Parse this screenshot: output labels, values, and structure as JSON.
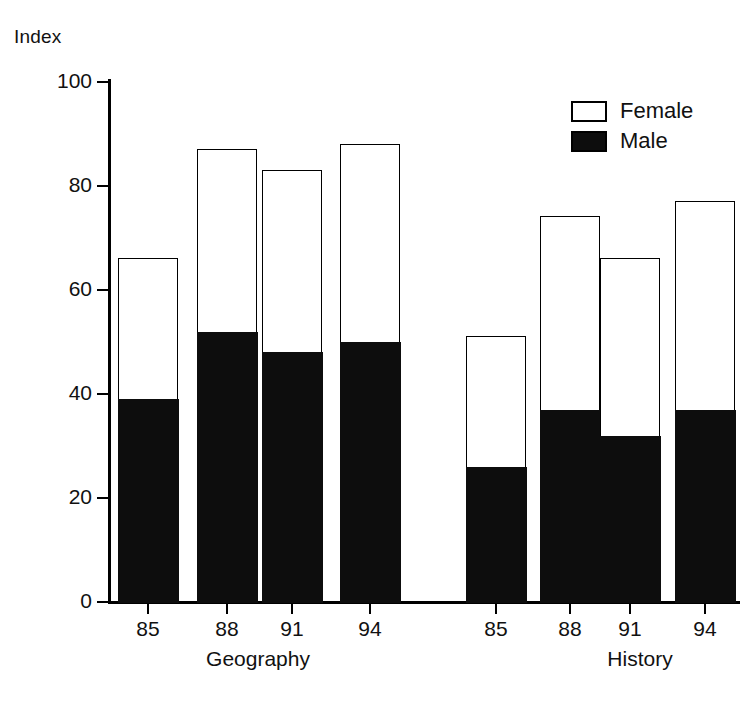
{
  "chart_data": {
    "type": "bar",
    "subtype": "stacked-bar",
    "title": "",
    "ylabel": "Index",
    "xlabel": "",
    "ylim": [
      0,
      100
    ],
    "yticks": [
      0,
      20,
      40,
      60,
      80,
      100
    ],
    "grid": false,
    "legend": {
      "position": "top-right",
      "entries": [
        {
          "name": "Female",
          "fill": "#ffffff",
          "stroke": "#000000"
        },
        {
          "name": "Male",
          "fill": "#0d0d0d",
          "stroke": "#000000"
        }
      ]
    },
    "groups": [
      {
        "name": "Geography",
        "categories": [
          "85",
          "88",
          "91",
          "94"
        ]
      },
      {
        "name": "History",
        "categories": [
          "85",
          "88",
          "91",
          "94"
        ]
      }
    ],
    "categories": [
      "85",
      "88",
      "91",
      "94",
      "85",
      "88",
      "91",
      "94"
    ],
    "series": [
      {
        "name": "Male",
        "values": [
          39,
          52,
          48,
          50,
          26,
          37,
          32,
          37
        ]
      },
      {
        "name": "Female",
        "values": [
          27,
          35,
          35,
          38,
          25,
          37,
          34,
          40
        ]
      }
    ],
    "totals": [
      66,
      87,
      83,
      88,
      51,
      74,
      66,
      77
    ],
    "bars": [
      {
        "group": "Geography",
        "category": "85",
        "male": 39,
        "total": 66
      },
      {
        "group": "Geography",
        "category": "88",
        "male": 52,
        "total": 87
      },
      {
        "group": "Geography",
        "category": "91",
        "male": 48,
        "total": 83
      },
      {
        "group": "Geography",
        "category": "94",
        "male": 50,
        "total": 88
      },
      {
        "group": "History",
        "category": "85",
        "male": 26,
        "total": 51
      },
      {
        "group": "History",
        "category": "88",
        "male": 37,
        "total": 74
      },
      {
        "group": "History",
        "category": "91",
        "male": 32,
        "total": 66
      },
      {
        "group": "History",
        "category": "94",
        "male": 37,
        "total": 77
      }
    ]
  },
  "axis": {
    "y_title": "Index",
    "tick_labels": [
      "100",
      "80",
      "60",
      "40",
      "20",
      "0"
    ]
  },
  "xaxis": {
    "tick_labels": [
      "85",
      "88",
      "91",
      "94",
      "85",
      "88",
      "91",
      "94"
    ],
    "group_labels": [
      "Geography",
      "History"
    ]
  },
  "legend": {
    "female_label": "Female",
    "male_label": "Male"
  },
  "colors": {
    "male": "#0d0d0d",
    "female": "#ffffff",
    "axis": "#000000",
    "background": "#ffffff"
  }
}
